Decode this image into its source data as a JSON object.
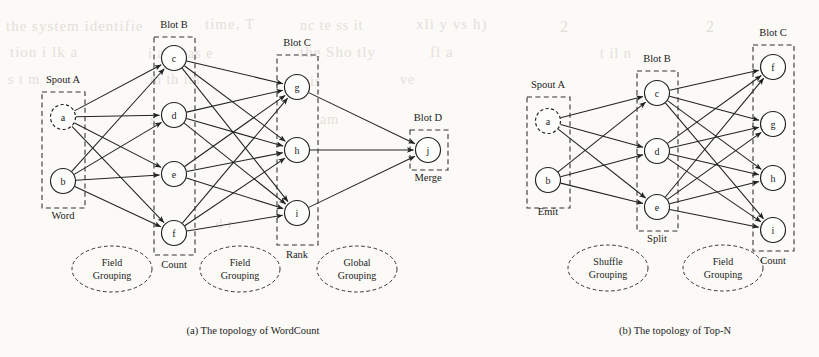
{
  "figure": {
    "background_color": "#fbfaf7",
    "ink_color": "#1b1b1b"
  },
  "ghost_text": [
    {
      "text": "the system identifie",
      "x": 6,
      "y": 18,
      "size": 15
    },
    {
      "text": "time, T",
      "x": 205,
      "y": 16,
      "size": 15
    },
    {
      "text": "nc   te  ss   it",
      "x": 300,
      "y": 18,
      "size": 14
    },
    {
      "text": "xli  y  vs  h)",
      "x": 416,
      "y": 16,
      "size": 15
    },
    {
      "text": "tion i  lk   a",
      "x": 10,
      "y": 44,
      "size": 15
    },
    {
      "text": "i  a   s pas  e",
      "x": 148,
      "y": 46,
      "size": 14
    },
    {
      "text": "the  Sho tly",
      "x": 300,
      "y": 44,
      "size": 15
    },
    {
      "text": "fl   a",
      "x": 430,
      "y": 44,
      "size": 15
    },
    {
      "text": "s t  m",
      "x": 8,
      "y": 72,
      "size": 14
    },
    {
      "text": "m th   im",
      "x": 150,
      "y": 72,
      "size": 14
    },
    {
      "text": "is",
      "x": 310,
      "y": 74,
      "size": 14
    },
    {
      "text": "ve",
      "x": 400,
      "y": 72,
      "size": 14
    },
    {
      "text": "s",
      "x": 150,
      "y": 112,
      "size": 14
    },
    {
      "text": "am",
      "x": 320,
      "y": 112,
      "size": 14
    },
    {
      "text": "2",
      "x": 560,
      "y": 18,
      "size": 16
    },
    {
      "text": "t  il   n",
      "x": 600,
      "y": 46,
      "size": 14
    },
    {
      "text": "2",
      "x": 706,
      "y": 18,
      "size": 16
    },
    {
      "text": "i",
      "x": 640,
      "y": 98,
      "size": 14
    },
    {
      "text": "d  r",
      "x": 216,
      "y": 216,
      "size": 13
    },
    {
      "text": "s",
      "x": 636,
      "y": 196,
      "size": 13
    }
  ],
  "diagrams": [
    {
      "id": "wordcount",
      "caption": "(a) The topology of WordCount",
      "caption_pos": {
        "x": 253,
        "y": 334
      },
      "groups": [
        {
          "id": "spout-a",
          "title": "Spout A",
          "title_pos": {
            "x": 63,
            "y": 83
          },
          "subtitle": "Word",
          "subtitle_pos": {
            "x": 63,
            "y": 219
          },
          "box": {
            "x": 42,
            "y": 92,
            "w": 43,
            "h": 116
          },
          "nodes": [
            {
              "label": "a",
              "cx": 63,
              "cy": 117,
              "r": 12.5,
              "style": "dashed"
            },
            {
              "label": "b",
              "cx": 63,
              "cy": 181,
              "r": 12.5,
              "style": "solid"
            }
          ]
        },
        {
          "id": "blot-b",
          "title": "Blot B",
          "title_pos": {
            "x": 174,
            "y": 28
          },
          "subtitle": "Count",
          "subtitle_pos": {
            "x": 174,
            "y": 268
          },
          "box": {
            "x": 154,
            "y": 37,
            "w": 41,
            "h": 218
          },
          "nodes": [
            {
              "label": "c",
              "cx": 174,
              "cy": 58,
              "r": 12.5,
              "style": "solid"
            },
            {
              "label": "d",
              "cx": 174,
              "cy": 115,
              "r": 12.5,
              "style": "solid"
            },
            {
              "label": "e",
              "cx": 174,
              "cy": 174,
              "r": 12.5,
              "style": "solid"
            },
            {
              "label": "f",
              "cx": 174,
              "cy": 233,
              "r": 12.5,
              "style": "solid"
            }
          ]
        },
        {
          "id": "blot-c",
          "title": "Blot C",
          "title_pos": {
            "x": 297,
            "y": 46
          },
          "subtitle": "Rank",
          "subtitle_pos": {
            "x": 297,
            "y": 258
          },
          "box": {
            "x": 277,
            "y": 55,
            "w": 41,
            "h": 190
          },
          "nodes": [
            {
              "label": "g",
              "cx": 297,
              "cy": 87,
              "r": 12.5,
              "style": "solid"
            },
            {
              "label": "h",
              "cx": 297,
              "cy": 150,
              "r": 12.5,
              "style": "solid"
            },
            {
              "label": "i",
              "cx": 297,
              "cy": 213,
              "r": 12.5,
              "style": "solid"
            }
          ]
        },
        {
          "id": "blot-d",
          "title": "Blot D",
          "title_pos": {
            "x": 428,
            "y": 121
          },
          "subtitle": "Merge",
          "subtitle_pos": {
            "x": 428,
            "y": 181
          },
          "box": {
            "x": 410,
            "y": 130,
            "w": 38,
            "h": 40
          },
          "nodes": [
            {
              "label": "j",
              "cx": 428,
              "cy": 150,
              "r": 12.5,
              "style": "solid"
            }
          ]
        }
      ],
      "ellipses": [
        {
          "lines": [
            "Field",
            "Grouping"
          ],
          "cx": 112,
          "cy": 269,
          "rx": 40,
          "ry": 23
        },
        {
          "lines": [
            "Field",
            "Grouping"
          ],
          "cx": 240,
          "cy": 269,
          "rx": 40,
          "ry": 23
        },
        {
          "lines": [
            "Global",
            "Grouping"
          ],
          "cx": 357,
          "cy": 269,
          "rx": 40,
          "ry": 23
        }
      ],
      "edges": [
        {
          "from": "a",
          "to": "c"
        },
        {
          "from": "a",
          "to": "d"
        },
        {
          "from": "a",
          "to": "e"
        },
        {
          "from": "a",
          "to": "f"
        },
        {
          "from": "b",
          "to": "c"
        },
        {
          "from": "b",
          "to": "d"
        },
        {
          "from": "b",
          "to": "e"
        },
        {
          "from": "b",
          "to": "f"
        },
        {
          "from": "c",
          "to": "g"
        },
        {
          "from": "c",
          "to": "h"
        },
        {
          "from": "c",
          "to": "i"
        },
        {
          "from": "d",
          "to": "g"
        },
        {
          "from": "d",
          "to": "h"
        },
        {
          "from": "d",
          "to": "i"
        },
        {
          "from": "e",
          "to": "g"
        },
        {
          "from": "e",
          "to": "h"
        },
        {
          "from": "e",
          "to": "i"
        },
        {
          "from": "f",
          "to": "g"
        },
        {
          "from": "f",
          "to": "h"
        },
        {
          "from": "f",
          "to": "i"
        },
        {
          "from": "g",
          "to": "j"
        },
        {
          "from": "h",
          "to": "j"
        },
        {
          "from": "i",
          "to": "j"
        }
      ]
    },
    {
      "id": "topn",
      "caption": "(b) The topology of Top-N",
      "caption_pos": {
        "x": 675,
        "y": 334
      },
      "groups": [
        {
          "id": "spout-a",
          "title": "Spout A",
          "title_pos": {
            "x": 548,
            "y": 88
          },
          "subtitle": "Emit",
          "subtitle_pos": {
            "x": 548,
            "y": 215
          },
          "box": {
            "x": 527,
            "y": 97,
            "w": 43,
            "h": 111
          },
          "nodes": [
            {
              "label": "a",
              "cx": 548,
              "cy": 121,
              "r": 12.5,
              "style": "dashed"
            },
            {
              "label": "b",
              "cx": 548,
              "cy": 180,
              "r": 12.5,
              "style": "solid"
            }
          ]
        },
        {
          "id": "blot-b",
          "title": "Blot B",
          "title_pos": {
            "x": 657,
            "y": 62
          },
          "subtitle": "Split",
          "subtitle_pos": {
            "x": 657,
            "y": 242
          },
          "box": {
            "x": 637,
            "y": 71,
            "w": 41,
            "h": 160
          },
          "nodes": [
            {
              "label": "c",
              "cx": 657,
              "cy": 93,
              "r": 12.5,
              "style": "solid"
            },
            {
              "label": "d",
              "cx": 657,
              "cy": 151,
              "r": 12.5,
              "style": "solid"
            },
            {
              "label": "e",
              "cx": 657,
              "cy": 207,
              "r": 12.5,
              "style": "solid"
            }
          ]
        },
        {
          "id": "blot-c",
          "title": "Blot C",
          "title_pos": {
            "x": 773,
            "y": 36
          },
          "subtitle": "Count",
          "subtitle_pos": {
            "x": 773,
            "y": 264
          },
          "box": {
            "x": 753,
            "y": 45,
            "w": 41,
            "h": 206
          },
          "nodes": [
            {
              "label": "f",
              "cx": 773,
              "cy": 67,
              "r": 12.5,
              "style": "solid"
            },
            {
              "label": "g",
              "cx": 773,
              "cy": 124,
              "r": 12.5,
              "style": "solid"
            },
            {
              "label": "h",
              "cx": 773,
              "cy": 178,
              "r": 12.5,
              "style": "solid"
            },
            {
              "label": "i",
              "cx": 773,
              "cy": 230,
              "r": 12.5,
              "style": "solid"
            }
          ]
        }
      ],
      "ellipses": [
        {
          "lines": [
            "Shuffle",
            "Grouping"
          ],
          "cx": 608,
          "cy": 268,
          "rx": 40,
          "ry": 23
        },
        {
          "lines": [
            "Field",
            "Grouping"
          ],
          "cx": 723,
          "cy": 268,
          "rx": 40,
          "ry": 23
        }
      ],
      "edges": [
        {
          "from": "a",
          "to": "c"
        },
        {
          "from": "a",
          "to": "d"
        },
        {
          "from": "a",
          "to": "e"
        },
        {
          "from": "b",
          "to": "c"
        },
        {
          "from": "b",
          "to": "d"
        },
        {
          "from": "b",
          "to": "e"
        },
        {
          "from": "c",
          "to": "f"
        },
        {
          "from": "c",
          "to": "g"
        },
        {
          "from": "c",
          "to": "h"
        },
        {
          "from": "c",
          "to": "i"
        },
        {
          "from": "d",
          "to": "f"
        },
        {
          "from": "d",
          "to": "g"
        },
        {
          "from": "d",
          "to": "h"
        },
        {
          "from": "d",
          "to": "i"
        },
        {
          "from": "e",
          "to": "f"
        },
        {
          "from": "e",
          "to": "g"
        },
        {
          "from": "e",
          "to": "h"
        },
        {
          "from": "e",
          "to": "i"
        }
      ]
    }
  ]
}
